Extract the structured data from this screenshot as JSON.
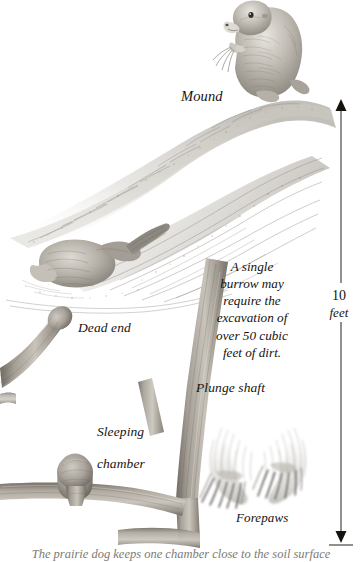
{
  "illustration": {
    "title": "Prairie dog burrow cutaway",
    "subject": "prairie-dog-burrow-cross-section",
    "background_color": "#ffffff",
    "ink_color": "#16130f",
    "pencil_gray": "#8d8a85",
    "soil_gray": "#a9a49c"
  },
  "labels": {
    "mound": "Mound",
    "dead_end": "Dead end",
    "sleeping_chamber_line1": "Sleeping",
    "sleeping_chamber_line2": "chamber",
    "plunge_shaft": "Plunge shaft",
    "forepaws": "Forepaws"
  },
  "annotation": {
    "line1": "A single",
    "line2": "burrow may",
    "line3": "require the",
    "line4": "excavation of",
    "line5": "over 50 cubic",
    "line6": "feet of dirt."
  },
  "scale": {
    "value": "10",
    "unit": "feet",
    "arrow": "double-headed-vertical-arrow"
  },
  "caption": {
    "text": "The prairie dog keeps one chamber close to the soil surface"
  },
  "figures": [
    {
      "name": "prairie-dog-sentinel",
      "description": "prairie dog sitting upright on mound eating a stem"
    },
    {
      "name": "prairie-dog-digging",
      "description": "prairie dog digging into the burrow entrance"
    },
    {
      "name": "forepaws-detail",
      "description": "pair of clawed forepaws detail study"
    }
  ],
  "burrow_parts": [
    {
      "name": "mound",
      "label": "Mound"
    },
    {
      "name": "plunge-shaft",
      "label": "Plunge shaft"
    },
    {
      "name": "dead-end",
      "label": "Dead end"
    },
    {
      "name": "sleeping-chamber",
      "label": "Sleeping chamber"
    }
  ]
}
